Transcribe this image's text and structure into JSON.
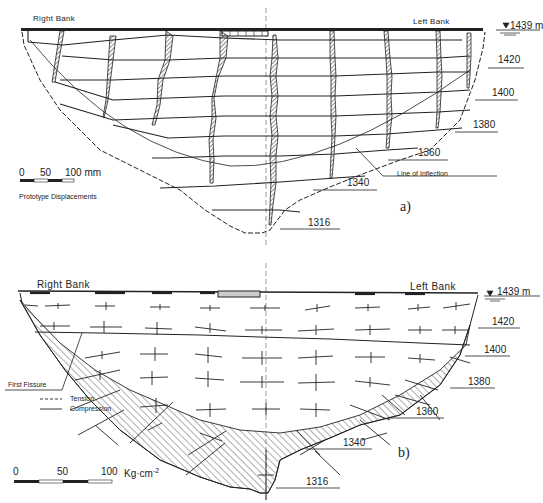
{
  "figure": {
    "panel_a": {
      "tag": "a)",
      "right_bank": "Right Bank",
      "left_bank": "Left Bank",
      "crest_elevation": "1439 m",
      "elevations": [
        "1420",
        "1400",
        "1380",
        "1360",
        "1340",
        "1316"
      ],
      "annotation_inflection": "Line of Inflection",
      "scale": {
        "ticks": [
          "0",
          "50",
          "100 mm"
        ],
        "caption": "Prototype Displacements"
      }
    },
    "panel_b": {
      "tag": "b)",
      "right_bank": "Right Bank",
      "left_bank": "Left Bank",
      "crest_elevation": "1439 m",
      "elevations": [
        "1420",
        "1400",
        "1380",
        "1360",
        "1340",
        "1316"
      ],
      "annotation_fissure": "First Fissure",
      "legend": {
        "tension": "Tension",
        "compression": "Compression"
      },
      "scale": {
        "ticks": [
          "0",
          "50",
          "100"
        ],
        "unit": "Kg·cm",
        "unit_exp": "-2"
      }
    }
  },
  "colors": {
    "ink": "#1a1a1a",
    "paper": "#ffffff",
    "hatch": "#333333"
  }
}
